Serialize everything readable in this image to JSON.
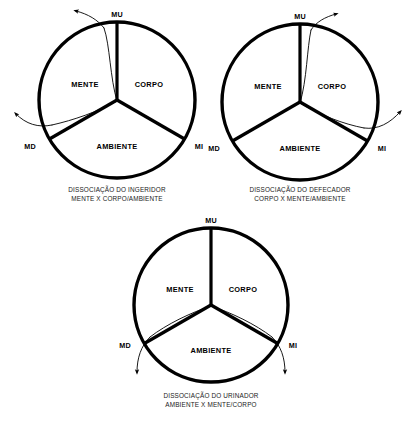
{
  "figure": {
    "title_visible": false,
    "background_color": "#ffffff",
    "stroke_color": "#000000",
    "diagram_count": 3
  },
  "common": {
    "sector_labels": {
      "mind": "MENTE",
      "body": "CORPO",
      "environment": "AMBIENTE"
    },
    "node_labels": {
      "top": "MU",
      "lower_left": "MD",
      "lower_right": "MI"
    }
  },
  "diagrams": [
    {
      "id": "ingeridor",
      "caption_line1": "DISSOCIAÇÃO DO INGERIDOR",
      "caption_line2": "MENTE X CORPO/AMBIENTE",
      "sectors": [
        "MENTE",
        "CORPO",
        "AMBIENTE"
      ],
      "nodes": [
        "MU",
        "MD",
        "MI"
      ],
      "dissociation_arrows": [
        {
          "from_node": "MU",
          "direction": "up-left"
        },
        {
          "from_node": "MD",
          "direction": "left"
        }
      ],
      "separated_sector": "MENTE"
    },
    {
      "id": "defecador",
      "caption_line1": "DISSOCIAÇÃO DO DEFECADOR",
      "caption_line2": "CORPO X MENTE/AMBIENTE",
      "sectors": [
        "MENTE",
        "CORPO",
        "AMBIENTE"
      ],
      "nodes": [
        "MU",
        "MD",
        "MI"
      ],
      "dissociation_arrows": [
        {
          "from_node": "MU",
          "direction": "up-right"
        },
        {
          "from_node": "MI",
          "direction": "right"
        }
      ],
      "separated_sector": "CORPO"
    },
    {
      "id": "urinador",
      "caption_line1": "DISSOCIAÇÃO DO URINADOR",
      "caption_line2": "AMBIENTE X MENTE/CORPO",
      "sectors": [
        "MENTE",
        "CORPO",
        "AMBIENTE"
      ],
      "nodes": [
        "MU",
        "MD",
        "MI"
      ],
      "dissociation_arrows": [
        {
          "from_node": "MD",
          "direction": "down"
        },
        {
          "from_node": "MI",
          "direction": "down"
        }
      ],
      "separated_sector": "AMBIENTE"
    }
  ]
}
